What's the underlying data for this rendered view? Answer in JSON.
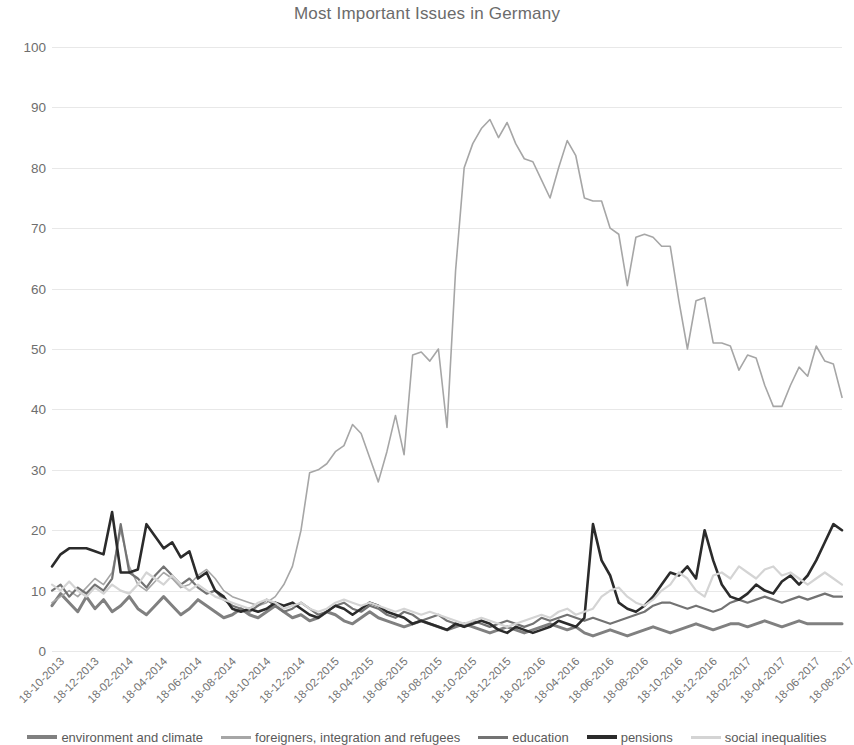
{
  "chart_data": {
    "type": "line",
    "title": "Most Important Issues in Germany",
    "xlabel": "",
    "ylabel": "",
    "ylim": [
      0,
      100
    ],
    "y_ticks": [
      0,
      10,
      20,
      30,
      40,
      50,
      60,
      70,
      80,
      90,
      100
    ],
    "grid": true,
    "legend_position": "bottom",
    "x_tick_labels": [
      "18-10-2013",
      "18-12-2013",
      "18-02-2014",
      "18-04-2014",
      "18-06-2014",
      "18-08-2014",
      "18-10-2014",
      "18-12-2014",
      "18-02-2015",
      "18-04-2015",
      "18-06-2015",
      "18-08-2015",
      "18-10-2015",
      "18-12-2015",
      "18-02-2016",
      "18-04-2016",
      "18-06-2016",
      "18-08-2016",
      "18-10-2016",
      "18-12-2016",
      "18-02-2017",
      "18-04-2017",
      "18-06-2017",
      "18-08-2017"
    ],
    "x_tick_step": 4,
    "n_points": 93,
    "series": [
      {
        "name": "environment and climate",
        "color": "#808080",
        "width": 3.0,
        "values": [
          7.5,
          9.5,
          8.0,
          6.5,
          9.0,
          7.0,
          8.5,
          6.5,
          7.5,
          9.0,
          7.0,
          6.0,
          7.5,
          9.0,
          7.5,
          6.0,
          7.0,
          8.5,
          7.5,
          6.5,
          5.5,
          6.0,
          7.0,
          6.0,
          5.5,
          6.5,
          7.5,
          6.5,
          5.5,
          6.0,
          5.0,
          5.5,
          6.5,
          6.0,
          5.0,
          4.5,
          5.5,
          6.5,
          5.5,
          5.0,
          4.5,
          4.0,
          4.5,
          5.0,
          4.5,
          4.0,
          3.5,
          4.0,
          4.5,
          4.0,
          3.5,
          3.0,
          3.5,
          4.0,
          3.5,
          3.0,
          3.5,
          4.0,
          4.5,
          4.0,
          3.5,
          4.0,
          3.0,
          2.5,
          3.0,
          3.5,
          3.0,
          2.5,
          3.0,
          3.5,
          4.0,
          3.5,
          3.0,
          3.5,
          4.0,
          4.5,
          4.0,
          3.5,
          4.0,
          4.5,
          4.5,
          4.0,
          4.5,
          5.0,
          4.5,
          4.0,
          4.5,
          5.0,
          4.5,
          4.5,
          4.5,
          4.5,
          4.5
        ]
      },
      {
        "name": "foreigners, integration and refugees",
        "color": "#a6a6a6",
        "width": 1.6,
        "values": [
          8.0,
          9.0,
          10.0,
          9.0,
          10.5,
          12.0,
          11.0,
          13.0,
          20.0,
          14.0,
          11.0,
          10.0,
          11.5,
          13.0,
          12.0,
          10.5,
          11.0,
          12.5,
          13.5,
          12.0,
          10.0,
          9.0,
          8.5,
          8.0,
          7.5,
          8.0,
          9.0,
          11.0,
          14.0,
          20.0,
          29.5,
          30.0,
          31.0,
          33.0,
          34.0,
          37.5,
          36.0,
          32.0,
          28.0,
          33.0,
          39.0,
          32.5,
          49.0,
          49.5,
          48.0,
          50.0,
          37.0,
          63.0,
          80.0,
          84.0,
          86.5,
          88.0,
          85.0,
          87.5,
          84.0,
          81.5,
          81.0,
          78.0,
          75.0,
          80.0,
          84.5,
          82.0,
          75.0,
          74.5,
          74.5,
          70.0,
          69.0,
          60.5,
          68.5,
          69.0,
          68.5,
          67.0,
          67.0,
          58.0,
          50.0,
          58.0,
          58.5,
          51.0,
          51.0,
          50.5,
          46.5,
          49.0,
          48.5,
          44.0,
          40.5,
          40.5,
          44.0,
          47.0,
          45.5,
          50.5,
          48.0,
          47.5,
          42.0
        ]
      },
      {
        "name": "education",
        "color": "#737373",
        "width": 2.2,
        "values": [
          10.0,
          11.0,
          9.0,
          10.5,
          9.5,
          11.0,
          10.0,
          12.0,
          21.0,
          13.0,
          12.0,
          10.5,
          12.5,
          14.0,
          12.5,
          11.0,
          12.0,
          10.5,
          9.5,
          10.0,
          8.5,
          7.5,
          7.0,
          6.5,
          7.5,
          8.5,
          7.5,
          6.5,
          7.0,
          8.0,
          7.0,
          6.0,
          6.5,
          7.5,
          8.0,
          7.0,
          6.5,
          7.5,
          7.0,
          6.0,
          5.5,
          6.5,
          6.0,
          5.0,
          5.5,
          6.0,
          5.0,
          4.5,
          4.0,
          5.0,
          4.5,
          4.0,
          4.5,
          5.0,
          4.5,
          4.0,
          4.5,
          5.5,
          5.0,
          5.5,
          6.0,
          5.5,
          5.0,
          5.5,
          5.0,
          4.5,
          5.0,
          5.5,
          6.0,
          6.5,
          7.5,
          8.0,
          8.0,
          7.5,
          7.0,
          7.5,
          7.0,
          6.5,
          7.0,
          8.0,
          8.5,
          8.0,
          8.5,
          9.0,
          8.5,
          8.0,
          8.5,
          9.0,
          8.5,
          9.0,
          9.5,
          9.0,
          9.0
        ]
      },
      {
        "name": "pensions",
        "color": "#2b2b2b",
        "width": 2.6,
        "values": [
          14.0,
          16.0,
          17.0,
          17.0,
          17.0,
          16.5,
          16.0,
          23.0,
          13.0,
          13.0,
          13.5,
          21.0,
          19.0,
          17.0,
          18.0,
          15.5,
          16.5,
          12.0,
          13.0,
          10.0,
          9.0,
          7.0,
          6.5,
          7.0,
          6.5,
          7.0,
          8.0,
          7.5,
          8.0,
          7.0,
          6.0,
          5.5,
          6.5,
          7.5,
          7.0,
          6.0,
          7.0,
          8.0,
          7.5,
          6.5,
          6.0,
          5.5,
          4.5,
          5.0,
          4.5,
          4.0,
          3.5,
          4.5,
          4.0,
          4.5,
          5.0,
          4.5,
          3.5,
          3.0,
          4.0,
          3.5,
          3.0,
          3.5,
          4.0,
          5.0,
          4.5,
          4.0,
          5.5,
          21.0,
          15.0,
          12.5,
          8.0,
          7.0,
          6.5,
          7.5,
          9.0,
          11.0,
          13.0,
          12.5,
          14.0,
          12.0,
          20.0,
          15.0,
          11.0,
          9.0,
          8.5,
          9.5,
          11.0,
          10.0,
          9.5,
          11.5,
          12.5,
          11.0,
          12.5,
          15.0,
          18.0,
          21.0,
          20.0
        ]
      },
      {
        "name": "social inequalities",
        "color": "#d4d4d4",
        "width": 2.2,
        "values": [
          11.0,
          10.0,
          11.5,
          10.0,
          9.0,
          10.5,
          9.5,
          11.0,
          10.0,
          9.5,
          11.0,
          13.0,
          12.0,
          11.0,
          12.5,
          11.0,
          10.0,
          11.0,
          10.0,
          9.0,
          8.5,
          8.0,
          7.5,
          7.0,
          8.0,
          8.5,
          8.0,
          7.0,
          7.5,
          8.0,
          7.0,
          6.5,
          7.0,
          8.0,
          8.5,
          8.0,
          7.5,
          8.0,
          7.5,
          7.0,
          6.5,
          7.0,
          6.5,
          6.0,
          6.5,
          6.0,
          5.5,
          5.0,
          4.5,
          5.0,
          5.5,
          5.0,
          4.5,
          4.0,
          4.5,
          5.0,
          5.5,
          6.0,
          5.5,
          6.5,
          7.0,
          6.0,
          6.5,
          7.0,
          9.0,
          10.0,
          10.5,
          9.0,
          8.0,
          7.5,
          8.5,
          10.0,
          11.0,
          13.0,
          12.0,
          10.0,
          9.0,
          12.5,
          13.0,
          12.0,
          14.0,
          13.0,
          12.0,
          13.5,
          14.0,
          12.5,
          13.0,
          12.0,
          11.0,
          12.0,
          13.0,
          12.0,
          11.0
        ]
      }
    ]
  },
  "legend": {
    "items": [
      {
        "label": "environment and climate"
      },
      {
        "label": "foreigners, integration and refugees"
      },
      {
        "label": "education"
      },
      {
        "label": "pensions"
      },
      {
        "label": "social inequalities"
      }
    ]
  }
}
